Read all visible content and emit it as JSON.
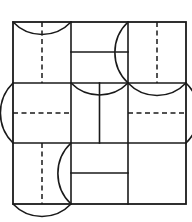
{
  "figure": {
    "background_color": "#ffffff",
    "stroke_color": "#1a1a1a",
    "solid_stroke_width": 1.6,
    "frame_stroke_width": 1.8,
    "dashed_stroke_width": 1.5,
    "dash_pattern": "5,3.5",
    "arc_stroke_width": 1.6
  },
  "geometry": {
    "frame": {
      "left": 13,
      "top": 22,
      "right": 186,
      "bottom": 204,
      "width": 173,
      "height": 182
    },
    "columns": {
      "x_edges": [
        13,
        71,
        128,
        186
      ],
      "count": 3
    },
    "rows": {
      "y_edges": [
        22,
        83,
        143,
        204
      ],
      "count": 3
    }
  },
  "cells": [
    {
      "id": "cell-r1c1",
      "row": 1,
      "column": 1,
      "label": "top-left",
      "bounds": [
        13,
        22,
        71,
        83
      ],
      "features": [
        "vertical-dashed-centerline",
        "arc-sagging-from-top-edge"
      ]
    },
    {
      "id": "cell-r1c2",
      "row": 1,
      "column": 2,
      "label": "top-middle",
      "bounds": [
        71,
        22,
        128,
        83
      ],
      "features": [
        "horizontal-solid-line-upper",
        "arc-bulging-left-from-right-edge"
      ]
    },
    {
      "id": "cell-r1c3",
      "row": 1,
      "column": 3,
      "label": "top-right",
      "bounds": [
        128,
        22,
        186,
        83
      ],
      "features": [
        "vertical-dashed-centerline",
        "arc-arching-up-from-bottom-edge"
      ]
    },
    {
      "id": "cell-r2c1",
      "row": 2,
      "column": 1,
      "label": "middle-left",
      "bounds": [
        13,
        83,
        71,
        143
      ],
      "features": [
        "horizontal-dashed-centerline",
        "arc-bulging-right-from-left-edge"
      ]
    },
    {
      "id": "cell-r2c2",
      "row": 2,
      "column": 2,
      "label": "middle-center",
      "bounds": [
        71,
        83,
        128,
        143
      ],
      "features": [
        "vertical-solid-centerline",
        "arc-sagging-from-top-edge"
      ]
    },
    {
      "id": "cell-r2c3",
      "row": 2,
      "column": 3,
      "label": "middle-right",
      "bounds": [
        128,
        83,
        186,
        143
      ],
      "features": [
        "horizontal-dashed-centerline",
        "arc-bulging-right-past-right-edge"
      ]
    },
    {
      "id": "cell-r3c1",
      "row": 3,
      "column": 1,
      "label": "bottom-left",
      "bounds": [
        13,
        143,
        71,
        204
      ],
      "features": [
        "vertical-dashed-centerline",
        "arc-arching-up-from-bottom-edge"
      ]
    },
    {
      "id": "cell-r3c2",
      "row": 3,
      "column": 2,
      "label": "bottom-middle",
      "bounds": [
        71,
        143,
        128,
        204
      ],
      "features": [
        "horizontal-solid-line-lower",
        "arc-bulging-right-from-left-edge"
      ]
    },
    {
      "id": "cell-r3c3",
      "row": 3,
      "column": 3,
      "label": "bottom-right",
      "bounds": [
        128,
        143,
        186,
        204
      ],
      "features": []
    }
  ],
  "lines": {
    "frame_edges": [
      {
        "name": "frame-top",
        "x1": 13,
        "y1": 22,
        "x2": 186,
        "y2": 22
      },
      {
        "name": "frame-bottom",
        "x1": 13,
        "y1": 204,
        "x2": 186,
        "y2": 204
      },
      {
        "name": "frame-left",
        "x1": 13,
        "y1": 22,
        "x2": 13,
        "y2": 204
      },
      {
        "name": "frame-right",
        "x1": 186,
        "y1": 22,
        "x2": 186,
        "y2": 204
      }
    ],
    "grid_dividers": [
      {
        "name": "divider-vertical-1",
        "x1": 71,
        "y1": 22,
        "x2": 71,
        "y2": 204
      },
      {
        "name": "divider-vertical-2",
        "x1": 128,
        "y1": 22,
        "x2": 128,
        "y2": 204
      },
      {
        "name": "divider-horizontal-1",
        "x1": 13,
        "y1": 83,
        "x2": 186,
        "y2": 83
      },
      {
        "name": "divider-horizontal-2",
        "x1": 13,
        "y1": 143,
        "x2": 186,
        "y2": 143
      }
    ],
    "interior_solid": [
      {
        "name": "top-middle-horizontal",
        "x1": 71,
        "y1": 52,
        "x2": 128,
        "y2": 52
      },
      {
        "name": "middle-center-vertical",
        "x1": 99.5,
        "y1": 83,
        "x2": 99.5,
        "y2": 143
      },
      {
        "name": "bottom-middle-horizontal",
        "x1": 71,
        "y1": 173,
        "x2": 128,
        "y2": 173
      }
    ],
    "interior_dashed": [
      {
        "name": "top-left-dashed-vertical",
        "x1": 42,
        "y1": 22,
        "x2": 42,
        "y2": 83
      },
      {
        "name": "top-right-dashed-vertical",
        "x1": 157,
        "y1": 22,
        "x2": 157,
        "y2": 83
      },
      {
        "name": "middle-left-dashed-horizontal",
        "x1": 13,
        "y1": 113,
        "x2": 71,
        "y2": 113
      },
      {
        "name": "middle-right-dashed-horizontal",
        "x1": 128,
        "y1": 113,
        "x2": 186,
        "y2": 113
      },
      {
        "name": "bottom-left-dashed-vertical",
        "x1": 42,
        "y1": 143,
        "x2": 42,
        "y2": 204
      }
    ]
  },
  "arcs": [
    {
      "name": "arc-top-left",
      "cell": "cell-r1c1",
      "path": "M 13 22 A 40 40 0 0 0 71 22",
      "direction": "sags-downward"
    },
    {
      "name": "arc-top-middle",
      "cell": "cell-r1c2",
      "path": "M 128 22 A 42 42 0 0 0 128 83",
      "direction": "bulges-left"
    },
    {
      "name": "arc-top-right",
      "cell": "cell-r1c3",
      "path": "M 128 83 A 40 40 0 0 0 186 83",
      "direction": "arches-upward"
    },
    {
      "name": "arc-middle-left",
      "cell": "cell-r2c1",
      "path": "M 13 83 A 42 42 0 0 0 13 143",
      "direction": "bulges-right"
    },
    {
      "name": "arc-middle-center",
      "cell": "cell-r2c2",
      "path": "M 71 83 A 40 40 0 0 0 128 83",
      "direction": "sags-downward"
    },
    {
      "name": "arc-middle-right",
      "cell": "cell-r2c3",
      "path": "M 186 83 A 42 42 0 0 1 186 143",
      "direction": "bulges-right-past-edge"
    },
    {
      "name": "arc-bottom-left",
      "cell": "cell-r3c1",
      "path": "M 13 204 A 40 40 0 0 0 71 204",
      "direction": "arches-upward"
    },
    {
      "name": "arc-bottom-middle",
      "cell": "cell-r3c2",
      "path": "M 71 143 A 42 42 0 0 0 71 204",
      "direction": "bulges-right"
    }
  ]
}
